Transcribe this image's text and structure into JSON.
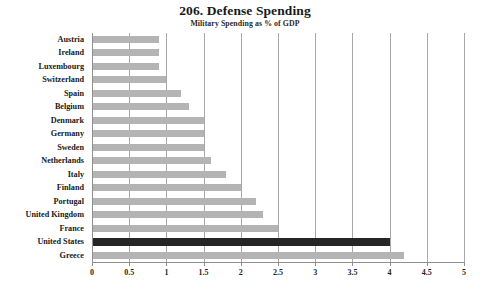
{
  "chart_data": {
    "type": "bar",
    "orientation": "horizontal",
    "title": "206. Defense Spending",
    "subtitle": "Military Spending as % of GDP",
    "xlabel": "",
    "ylabel": "",
    "xlim": [
      0,
      5
    ],
    "xticks": [
      0,
      0.5,
      1,
      1.5,
      2,
      2.5,
      3,
      3.5,
      4,
      4.5,
      5
    ],
    "xticklabels": [
      "0",
      "0.5",
      "1",
      "1.5",
      "2",
      "2.5",
      "3",
      "3.5",
      "4",
      "4.5",
      "5"
    ],
    "grid": true,
    "grid_axis": "x",
    "legend": false,
    "bar_color": "#b4b4b4",
    "highlight_color": "#262626",
    "highlight_category": "United States",
    "categories": [
      "Austria",
      "Ireland",
      "Luxembourg",
      "Switzerland",
      "Spain",
      "Belgium",
      "Denmark",
      "Germany",
      "Sweden",
      "Netherlands",
      "Italy",
      "Finland",
      "Portugal",
      "United Kingdom",
      "France",
      "United States",
      "Greece"
    ],
    "values": [
      0.9,
      0.9,
      0.9,
      1.0,
      1.2,
      1.3,
      1.5,
      1.5,
      1.5,
      1.6,
      1.8,
      2.0,
      2.2,
      2.3,
      2.5,
      4.0,
      4.2
    ]
  }
}
